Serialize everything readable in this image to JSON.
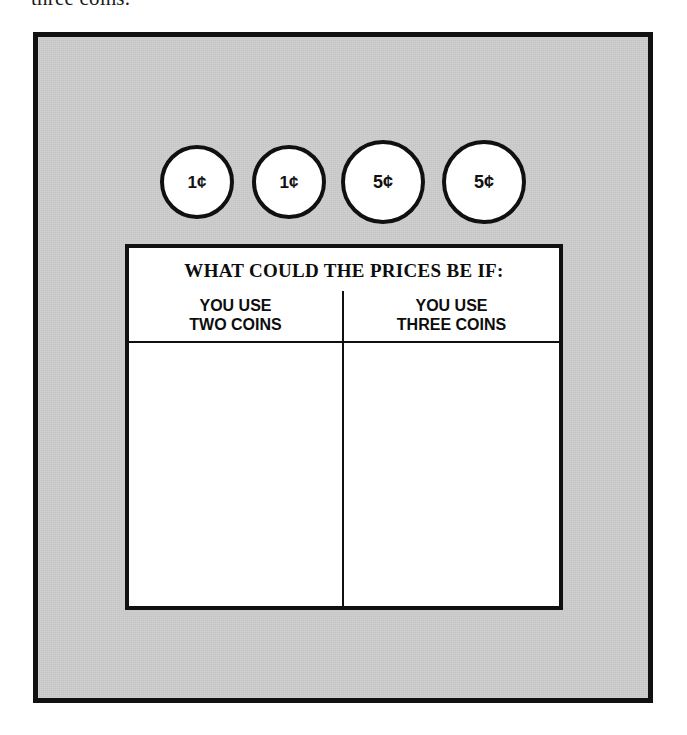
{
  "page": {
    "top_text_fragment": "three coins.",
    "background_color": "#ffffff",
    "panel_color": "#cacaca",
    "ink_color": "#101010"
  },
  "coins": {
    "items": [
      {
        "value": "1¢",
        "denomination": "penny",
        "size": "small"
      },
      {
        "value": "1¢",
        "denomination": "penny",
        "size": "small"
      },
      {
        "value": "5¢",
        "denomination": "nickel",
        "size": "large"
      },
      {
        "value": "5¢",
        "denomination": "nickel",
        "size": "large"
      }
    ]
  },
  "table": {
    "title": "WHAT COULD THE PRICES BE IF:",
    "columns": [
      {
        "line1": "YOU USE",
        "line2": "TWO COINS"
      },
      {
        "line1": "YOU USE",
        "line2": "THREE COINS"
      }
    ],
    "rows": [
      {
        "two_coins": "",
        "three_coins": ""
      }
    ]
  }
}
